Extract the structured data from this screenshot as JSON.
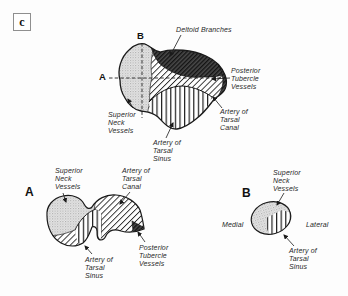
{
  "figure": {
    "panel_label": "c"
  },
  "colors": {
    "ink": "#1a1a1a",
    "background": "#fdfdfd",
    "stipple_gray": "#bdbdbd",
    "dark_region": "#2f2f2f"
  },
  "top_view": {
    "marker_a": "A",
    "marker_b": "B",
    "labels": {
      "deltoid_branches": "Deltoid Branches",
      "posterior_tubercle_vessels": "Posterior\nTubercle\nVessels",
      "artery_of_tarsal_canal": "Artery of\nTarsal\nCanal",
      "superior_neck_vessels": "Superior\nNeck\nVessels",
      "artery_of_tarsal_sinus": "Artery of\nTarsal\nSinus"
    }
  },
  "section_a": {
    "marker": "A",
    "labels": {
      "superior_neck_vessels": "Superior\nNeck\nVessels",
      "artery_of_tarsal_canal": "Artery of\nTarsal\nCanal",
      "artery_of_tarsal_sinus": "Artery of\nTarsal\nSinus",
      "posterior_tubercle_vessels": "Posterior\nTubercle\nVessels"
    }
  },
  "section_b": {
    "marker": "B",
    "labels": {
      "superior_neck_vessels": "Superior\nNeck\nVessels",
      "medial": "Medial",
      "lateral": "Lateral",
      "artery_of_tarsal_sinus": "Artery of\nTarsal\nSinus"
    }
  }
}
